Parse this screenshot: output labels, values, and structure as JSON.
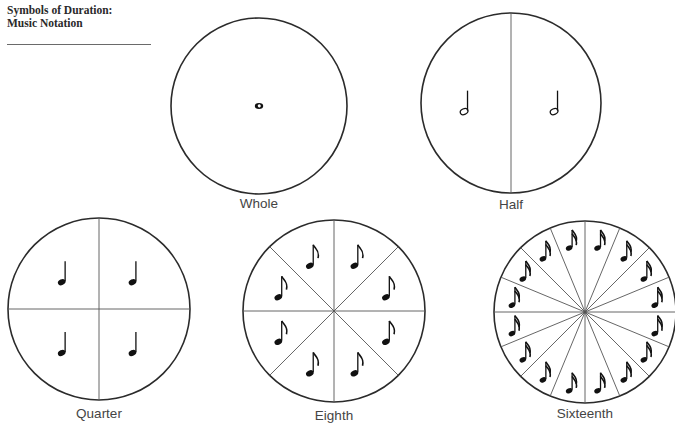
{
  "header": {
    "title_line1": "Symbols of Duration:",
    "title_line2": "Music Notation"
  },
  "diagrams": [
    {
      "name": "whole",
      "label": "Whole",
      "divisions": 1,
      "note": "whole-note",
      "cx": 259,
      "cy": 106,
      "r": 88
    },
    {
      "name": "half",
      "label": "Half",
      "divisions": 2,
      "note": "half-note",
      "cx": 511,
      "cy": 103,
      "r": 90
    },
    {
      "name": "quarter",
      "label": "Quarter",
      "divisions": 4,
      "note": "quarter-note",
      "cx": 99,
      "cy": 309,
      "r": 91
    },
    {
      "name": "eighth",
      "label": "Eighth",
      "divisions": 8,
      "note": "eighth-note",
      "cx": 334,
      "cy": 311,
      "r": 91
    },
    {
      "name": "sixteenth",
      "label": "Sixteenth",
      "divisions": 16,
      "note": "sixteenth-note",
      "cx": 585,
      "cy": 312,
      "r": 91
    }
  ],
  "colors": {
    "line": "#2b2b2b",
    "ink": "#111111",
    "label": "#444444"
  }
}
